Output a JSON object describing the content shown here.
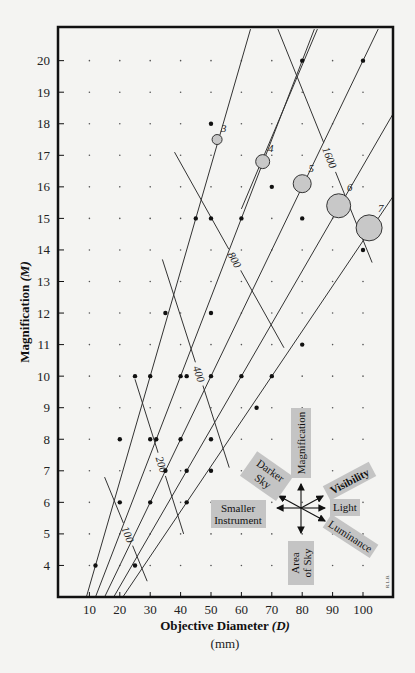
{
  "chart_data": {
    "type": "line",
    "title": "",
    "xlabel": "Objective Diameter (D)",
    "xlabel_main": "Objective Diameter",
    "xlabel_var": "(D)",
    "xunit": "(mm)",
    "ylabel": "Magnification (M)",
    "ylabel_main": "Magnification",
    "ylabel_var": "(M)",
    "xlim": [
      0,
      110
    ],
    "ylim": [
      3,
      21
    ],
    "xticks": [
      10,
      20,
      30,
      40,
      50,
      60,
      70,
      80,
      90,
      100
    ],
    "yticks": [
      4,
      5,
      6,
      7,
      8,
      9,
      10,
      11,
      12,
      13,
      14,
      15,
      16,
      17,
      18,
      19,
      20
    ],
    "grid": "dots",
    "exit_pupil_lines": [
      {
        "label": "3",
        "exit_pupil_mm": 3,
        "circle_radius_px": 5
      },
      {
        "label": "4",
        "exit_pupil_mm": 4,
        "circle_radius_px": 7
      },
      {
        "label": "5",
        "exit_pupil_mm": 5,
        "circle_radius_px": 9
      },
      {
        "label": "6",
        "exit_pupil_mm": 6,
        "circle_radius_px": 12
      },
      {
        "label": "7",
        "exit_pupil_mm": 7,
        "circle_radius_px": 13
      }
    ],
    "exit_pupil_circles": [
      {
        "label": "3",
        "D": 52,
        "M": 17.5
      },
      {
        "label": "4",
        "D": 67,
        "M": 16.8
      },
      {
        "label": "5",
        "D": 80,
        "M": 16.1
      },
      {
        "label": "6",
        "D": 92,
        "M": 15.4
      },
      {
        "label": "7",
        "D": 102,
        "M": 14.7
      }
    ],
    "product_curves": [
      {
        "label": "100",
        "D_x_M": 100,
        "from": [
          15,
          6.8
        ],
        "to": [
          29,
          3.5
        ]
      },
      {
        "label": "200",
        "D_x_M": 200,
        "from": [
          25,
          9.9
        ],
        "to": [
          41,
          5.0
        ]
      },
      {
        "label": "400",
        "D_x_M": 400,
        "from": [
          34,
          13.7
        ],
        "to": [
          56,
          7.1
        ]
      },
      {
        "label": "800",
        "D_x_M": 800,
        "from": [
          38,
          17.1
        ],
        "to": [
          74,
          10.9
        ]
      },
      {
        "label": "1600",
        "D_x_M": 1600,
        "from": [
          72,
          21
        ],
        "to": [
          103,
          13.6
        ]
      },
      {
        "label": "",
        "D_x_M": 1600,
        "from": [
          85,
          21
        ],
        "to": [
          60,
          15.3
        ]
      }
    ],
    "highlighted_points": [
      {
        "D": 80,
        "M": 20
      },
      {
        "D": 100,
        "M": 20
      },
      {
        "D": 50,
        "M": 18
      },
      {
        "D": 70,
        "M": 16
      },
      {
        "D": 45,
        "M": 15
      },
      {
        "D": 50,
        "M": 15
      },
      {
        "D": 60,
        "M": 15
      },
      {
        "D": 80,
        "M": 15
      },
      {
        "D": 100,
        "M": 14
      },
      {
        "D": 50,
        "M": 12
      },
      {
        "D": 35,
        "M": 12
      },
      {
        "D": 80,
        "M": 11
      },
      {
        "D": 25,
        "M": 10
      },
      {
        "D": 30,
        "M": 10
      },
      {
        "D": 40,
        "M": 10
      },
      {
        "D": 42,
        "M": 10
      },
      {
        "D": 50,
        "M": 10
      },
      {
        "D": 60,
        "M": 10
      },
      {
        "D": 70,
        "M": 10
      },
      {
        "D": 65,
        "M": 9
      },
      {
        "D": 20,
        "M": 8
      },
      {
        "D": 30,
        "M": 8
      },
      {
        "D": 32,
        "M": 8
      },
      {
        "D": 40,
        "M": 8
      },
      {
        "D": 50,
        "M": 8
      },
      {
        "D": 35,
        "M": 7
      },
      {
        "D": 42,
        "M": 7
      },
      {
        "D": 50,
        "M": 7
      },
      {
        "D": 20,
        "M": 6
      },
      {
        "D": 30,
        "M": 6
      },
      {
        "D": 42,
        "M": 6
      },
      {
        "D": 12,
        "M": 4
      },
      {
        "D": 25,
        "M": 4
      }
    ],
    "legend": {
      "type": "direction-rose",
      "up": "Magnification",
      "down": "Area of Sky",
      "left": "Smaller Instrument",
      "right": "Light",
      "up_left": "Darker Sky",
      "up_right": "Visibility",
      "down_right": "Luminance"
    },
    "credit": "R.L.B."
  },
  "labels": {
    "xlabel_main": "Objective Diameter ",
    "xlabel_var": "(D)",
    "xunit": "(mm)",
    "ylabel_main": "Magnification ",
    "ylabel_var": "(M)",
    "legend_magnification": "Magnification",
    "legend_area1": "Area",
    "legend_area2": "of Sky",
    "legend_smaller1": "Smaller",
    "legend_smaller2": "Instrument",
    "legend_light": "Light",
    "legend_darker1": "Darker",
    "legend_darker2": "Sky",
    "legend_visibility": "Visibility",
    "legend_luminance": "Luminance",
    "credit": "R.L.B."
  },
  "colors": {
    "frame": "#111111",
    "line": "#333333",
    "circle_fill": "#c8c8c8",
    "legend_box": "#c4c4c4",
    "background": "#f4f4f2",
    "dot": "#111111"
  }
}
